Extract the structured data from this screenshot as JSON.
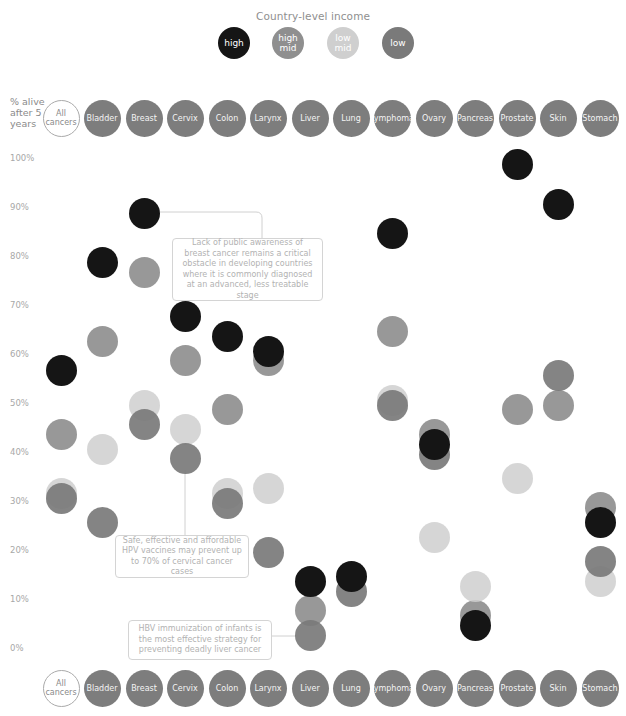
{
  "legend": {
    "title": "Country-level income",
    "items": [
      {
        "key": "high",
        "label": "high",
        "color": "#151515"
      },
      {
        "key": "high_mid",
        "label": "high mid",
        "color": "#8f8f8f"
      },
      {
        "key": "low_mid",
        "label": "low mid",
        "color": "#cfcfcf"
      },
      {
        "key": "low",
        "label": "low",
        "color": "#7a7a7a"
      }
    ]
  },
  "axis": {
    "y_title": "% alive after 5 years",
    "ticks": [
      "100%",
      "90%",
      "80%",
      "70%",
      "60%",
      "50%",
      "40%",
      "30%",
      "20%",
      "10%",
      "0%"
    ]
  },
  "categories": [
    "All cancers",
    "Bladder",
    "Breast",
    "Cervix",
    "Colon",
    "Larynx",
    "Liver",
    "Lung",
    "Lymphoma",
    "Ovary",
    "Pancreas",
    "Prostate",
    "Skin",
    "Stomach"
  ],
  "annotations": [
    {
      "id": "breast",
      "text": "Lack of public awareness of breast cancer remains a critical obstacle in developing countries where it is commonly diagnosed at an advanced, less treatable stage"
    },
    {
      "id": "cervix",
      "text": "Safe, effective and affordable HPV vaccines may prevent up to 70% of cervical cancer cases"
    },
    {
      "id": "liver",
      "text": "HBV immunization of infants is the most effective strategy for preventing deadly liver cancer"
    }
  ],
  "chart_data": {
    "type": "scatter",
    "title": "Country-level income",
    "xlabel": "Cancer type",
    "ylabel": "% alive after 5 years",
    "ylim": [
      0,
      100
    ],
    "grid": false,
    "legend_position": "top",
    "categories": [
      "All cancers",
      "Bladder",
      "Breast",
      "Cervix",
      "Colon",
      "Larynx",
      "Liver",
      "Lung",
      "Lymphoma",
      "Ovary",
      "Pancreas",
      "Prostate",
      "Skin",
      "Stomach"
    ],
    "series": [
      {
        "name": "high",
        "color": "#151515",
        "values": [
          57,
          79,
          89,
          68,
          64,
          61,
          14,
          15,
          85,
          42,
          5,
          99,
          91,
          26
        ]
      },
      {
        "name": "high mid",
        "color": "#8f8f8f",
        "values": [
          44,
          63,
          77,
          59,
          49,
          59,
          8,
          null,
          65,
          44,
          7,
          49,
          50,
          29
        ]
      },
      {
        "name": "low mid",
        "color": "#cfcfcf",
        "values": [
          32,
          41,
          50,
          45,
          32,
          33,
          null,
          null,
          51,
          23,
          13,
          35,
          null,
          14
        ]
      },
      {
        "name": "low",
        "color": "#7a7a7a",
        "values": [
          31,
          26,
          46,
          39,
          30,
          20,
          3,
          12,
          50,
          40,
          null,
          null,
          56,
          18
        ]
      }
    ]
  }
}
